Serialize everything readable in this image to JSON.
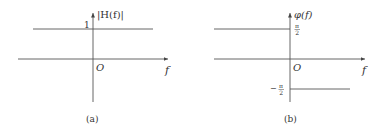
{
  "figure": {
    "panels": [
      {
        "id": "a",
        "caption": "(a)",
        "y_label": "|H(f)|",
        "x_label": "f",
        "origin_label": "O",
        "tick_label": "1",
        "description": "Magnitude response: constant 1 for all f"
      },
      {
        "id": "b",
        "caption": "(b)",
        "y_label": "φ(f)",
        "x_label": "f",
        "origin_label": "O",
        "tick_upper_num": "π",
        "tick_upper_den": "2",
        "tick_lower_sign": "−",
        "tick_lower_num": "π",
        "tick_lower_den": "2",
        "description": "Phase response: π/2 for f<0, −π/2 for f>0"
      }
    ],
    "colors": {
      "line": "#555555",
      "text": "#333333"
    }
  }
}
